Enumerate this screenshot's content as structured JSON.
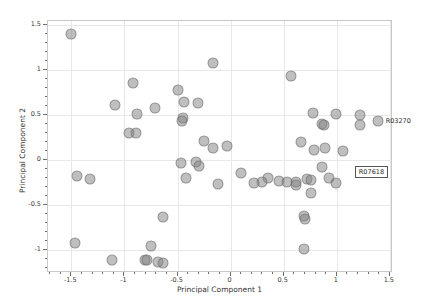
{
  "chart_data": {
    "type": "scatter",
    "title": "",
    "xlabel": "Principal Component 1",
    "ylabel": "Principal Component 2",
    "xlim": [
      -1.72,
      1.53
    ],
    "ylim": [
      -1.26,
      1.55
    ],
    "xticks": [
      -1.5,
      -1,
      -0.5,
      0,
      0.5,
      1,
      1.5
    ],
    "xticklabels": [
      "-1.5",
      "-1",
      "-0.5",
      "0",
      "0.5",
      "1",
      "1.5"
    ],
    "yticks": [
      -1,
      -0.5,
      0,
      0.5,
      1,
      1.5
    ],
    "yticklabels": [
      "-1",
      "-0.5",
      "0",
      "0.5",
      "1",
      "1.5"
    ],
    "grid": true,
    "legend": "none",
    "marker_color": "#808080",
    "marker_opacity": 0.5,
    "points": [
      {
        "x": -1.5,
        "y": 1.4
      },
      {
        "x": -0.17,
        "y": 1.08
      },
      {
        "x": -0.92,
        "y": 0.86
      },
      {
        "x": -0.5,
        "y": 0.78
      },
      {
        "x": -1.09,
        "y": 0.61
      },
      {
        "x": -0.44,
        "y": 0.65
      },
      {
        "x": -0.31,
        "y": 0.64
      },
      {
        "x": -0.71,
        "y": 0.58
      },
      {
        "x": -0.88,
        "y": 0.51
      },
      {
        "x": -0.45,
        "y": 0.47
      },
      {
        "x": -0.46,
        "y": 0.43
      },
      {
        "x": -0.96,
        "y": 0.3
      },
      {
        "x": -0.89,
        "y": 0.3
      },
      {
        "x": 0.57,
        "y": 0.94
      },
      {
        "x": 0.78,
        "y": 0.52
      },
      {
        "x": 0.99,
        "y": 0.51
      },
      {
        "x": 1.22,
        "y": 0.5
      },
      {
        "x": 1.39,
        "y": 0.44
      },
      {
        "x": 1.22,
        "y": 0.39
      },
      {
        "x": 0.86,
        "y": 0.4
      },
      {
        "x": 0.88,
        "y": 0.39
      },
      {
        "x": -0.25,
        "y": 0.21
      },
      {
        "x": -0.03,
        "y": 0.16
      },
      {
        "x": -0.17,
        "y": 0.13
      },
      {
        "x": 0.66,
        "y": 0.2
      },
      {
        "x": 0.89,
        "y": 0.13
      },
      {
        "x": 0.79,
        "y": 0.11
      },
      {
        "x": 1.06,
        "y": 0.1
      },
      {
        "x": -0.47,
        "y": -0.03
      },
      {
        "x": -0.33,
        "y": -0.02
      },
      {
        "x": -0.3,
        "y": -0.07
      },
      {
        "x": -0.12,
        "y": -0.27
      },
      {
        "x": 0.1,
        "y": -0.14
      },
      {
        "x": 0.35,
        "y": -0.2
      },
      {
        "x": 0.46,
        "y": -0.23
      },
      {
        "x": 0.53,
        "y": -0.24
      },
      {
        "x": 0.62,
        "y": -0.24
      },
      {
        "x": 0.72,
        "y": -0.21
      },
      {
        "x": 0.76,
        "y": -0.22
      },
      {
        "x": 0.62,
        "y": -0.28
      },
      {
        "x": 0.3,
        "y": -0.25
      },
      {
        "x": 0.22,
        "y": -0.26
      },
      {
        "x": 0.86,
        "y": -0.08
      },
      {
        "x": 0.93,
        "y": -0.2
      },
      {
        "x": 0.99,
        "y": -0.26
      },
      {
        "x": 0.76,
        "y": -0.37
      },
      {
        "x": -0.42,
        "y": -0.2
      },
      {
        "x": -1.45,
        "y": -0.18
      },
      {
        "x": -1.32,
        "y": -0.21
      },
      {
        "x": -0.64,
        "y": -0.64
      },
      {
        "x": 0.69,
        "y": -0.62
      },
      {
        "x": 0.7,
        "y": -0.66
      },
      {
        "x": -1.47,
        "y": -0.93
      },
      {
        "x": -1.12,
        "y": -1.11
      },
      {
        "x": -0.75,
        "y": -0.96
      },
      {
        "x": -0.81,
        "y": -1.11
      },
      {
        "x": -0.79,
        "y": -1.12
      },
      {
        "x": -0.68,
        "y": -1.14
      },
      {
        "x": -0.64,
        "y": -1.15
      },
      {
        "x": 0.69,
        "y": -0.99
      }
    ],
    "annotations": [
      {
        "text": "R03270",
        "x": 1.47,
        "y": 0.42,
        "boxed": false
      },
      {
        "text": "R07618",
        "x": 1.18,
        "y": -0.14,
        "boxed": true
      }
    ]
  }
}
